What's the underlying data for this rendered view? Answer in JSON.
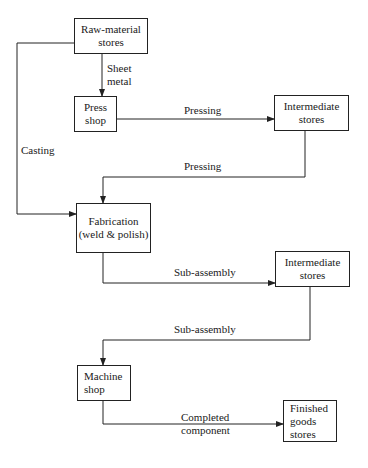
{
  "nodes": {
    "raw_material": {
      "line1": "Raw-material",
      "line2": "stores"
    },
    "press_shop": {
      "line1": "Press",
      "line2": "shop"
    },
    "intermediate_1": {
      "line1": "Intermediate",
      "line2": "stores"
    },
    "fabrication": {
      "line1": "Fabrication",
      "line2": "(weld & polish)"
    },
    "intermediate_2": {
      "line1": "Intermediate",
      "line2": "stores"
    },
    "machine_shop": {
      "line1": "Machine",
      "line2": "shop"
    },
    "finished_goods": {
      "line1": "Finished",
      "line2": "goods",
      "line3": "stores"
    }
  },
  "edges": {
    "sheet_metal": {
      "line1": "Sheet",
      "line2": "metal"
    },
    "casting": "Casting",
    "pressing_1": "Pressing",
    "pressing_2": "Pressing",
    "subassembly_1": "Sub-assembly",
    "subassembly_2": "Sub-assembly",
    "completed": {
      "line1": "Completed",
      "line2": "component"
    }
  }
}
